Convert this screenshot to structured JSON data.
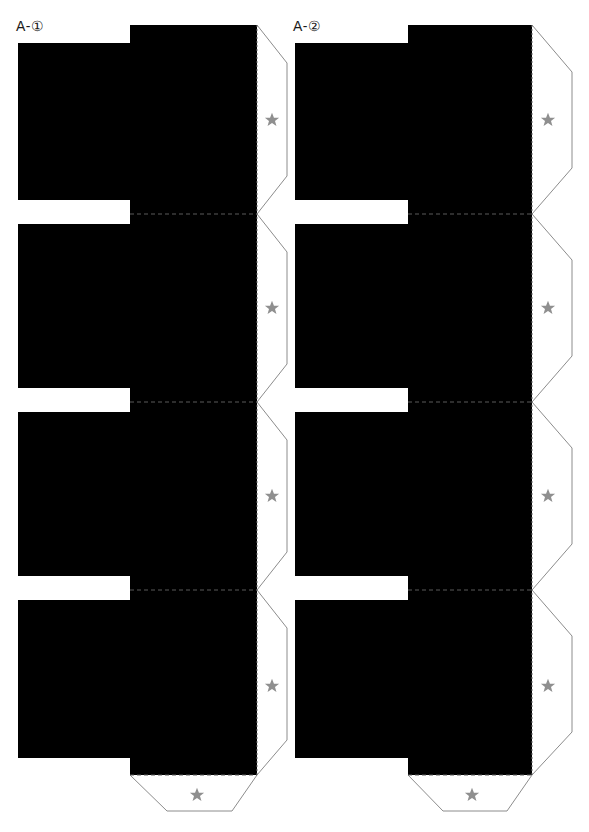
{
  "sheet": {
    "width": 589,
    "height": 832,
    "background_color": "#ffffff",
    "kind": "papercraft-fold-template"
  },
  "labels": [
    {
      "id": "a1",
      "text": "A-①",
      "x": 16,
      "y": 18
    },
    {
      "id": "a2",
      "text": "A-②",
      "x": 293,
      "y": 18
    }
  ],
  "colors": {
    "panel_fill": "#000000",
    "cut_line": "#8c8c8c",
    "fold_line": "#5a5a5a",
    "star": "#8f8f8f",
    "label_text": "#1a1a1a"
  },
  "icons": {
    "star": "star-icon"
  },
  "columns": [
    {
      "name": "column-a1",
      "label": "A-①",
      "left_edge_x": 18,
      "step_x": 130,
      "right_edge_x": 257,
      "flap_outer_x": 287,
      "panels": [
        {
          "index": 1,
          "top_y": 25,
          "bottom_y": 214,
          "notch_top_y": 200,
          "notch_bottom_y": 224
        },
        {
          "index": 2,
          "top_y": 214,
          "bottom_y": 402,
          "notch_top_y": 388,
          "notch_bottom_y": 412
        },
        {
          "index": 3,
          "top_y": 402,
          "bottom_y": 590,
          "notch_top_y": 576,
          "notch_bottom_y": 600
        },
        {
          "index": 4,
          "top_y": 590,
          "bottom_y": 775,
          "notch_top_y": 758,
          "notch_bottom_y": 775
        }
      ],
      "side_flaps": [
        {
          "index": 1,
          "star_x": 272,
          "star_y": 120
        },
        {
          "index": 2,
          "star_x": 272,
          "star_y": 308
        },
        {
          "index": 3,
          "star_x": 272,
          "star_y": 496
        },
        {
          "index": 4,
          "star_x": 272,
          "star_y": 686
        }
      ],
      "bottom_flap": {
        "star_x": 197,
        "star_y": 795,
        "top_y": 775,
        "bottom_y": 811
      }
    },
    {
      "name": "column-a2",
      "label": "A-②",
      "left_edge_x": 295,
      "step_x": 408,
      "right_edge_x": 532,
      "flap_outer_x": 572,
      "panels": [
        {
          "index": 1,
          "top_y": 25,
          "bottom_y": 214,
          "notch_top_y": 200,
          "notch_bottom_y": 224
        },
        {
          "index": 2,
          "top_y": 214,
          "bottom_y": 402,
          "notch_top_y": 388,
          "notch_bottom_y": 412
        },
        {
          "index": 3,
          "top_y": 402,
          "bottom_y": 590,
          "notch_top_y": 576,
          "notch_bottom_y": 600
        },
        {
          "index": 4,
          "top_y": 590,
          "bottom_y": 775,
          "notch_top_y": 758,
          "notch_bottom_y": 775
        }
      ],
      "side_flaps": [
        {
          "index": 1,
          "star_x": 548,
          "star_y": 120
        },
        {
          "index": 2,
          "star_x": 548,
          "star_y": 308
        },
        {
          "index": 3,
          "star_x": 548,
          "star_y": 496
        },
        {
          "index": 4,
          "star_x": 548,
          "star_y": 686
        }
      ],
      "bottom_flap": {
        "star_x": 472,
        "star_y": 795,
        "top_y": 775,
        "bottom_y": 811
      }
    }
  ]
}
